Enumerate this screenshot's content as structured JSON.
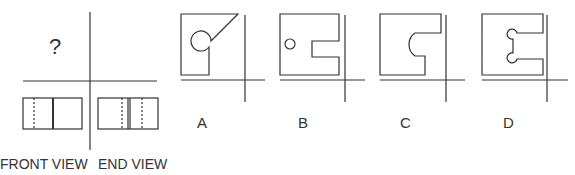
{
  "question": {
    "unknown_view_marker": "?",
    "view_labels": {
      "front": "FRONT VIEW",
      "end": "END VIEW"
    }
  },
  "options": [
    {
      "label": "A",
      "description": "square with circular notch and diagonal cut-out to top-right"
    },
    {
      "label": "B",
      "description": "square with small circular hole and rectangular slot on right"
    },
    {
      "label": "C",
      "description": "square with rectangular slot ending in large semicircle"
    },
    {
      "label": "D",
      "description": "square with slot ending in two small semicircular lobes"
    }
  ],
  "colors": {
    "stroke": "#333333",
    "background": "#ffffff"
  }
}
